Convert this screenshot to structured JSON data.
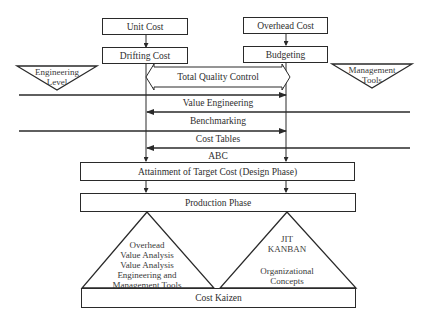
{
  "diagram": {
    "top_boxes": {
      "unit_cost": "Unit Cost",
      "drifting_cost": "Drifting Cost",
      "overhead_cost": "Overhead Cost",
      "budgeting": "Budgeting"
    },
    "side_triangles": {
      "engineering_level": [
        "Engineering",
        "Level"
      ],
      "management_tools": [
        "Management",
        "Tools"
      ]
    },
    "tqc": "Total Quality Control",
    "flow_lines": [
      {
        "label": "Value Engineering",
        "direction": "right"
      },
      {
        "label": "Benchmarking",
        "direction": "left"
      },
      {
        "label": "Cost Tables",
        "direction": "right"
      },
      {
        "label": "ABC",
        "direction": "left"
      }
    ],
    "attainment": "Attainment of Target Cost (Design Phase)",
    "production": "Production Phase",
    "bottom_triangles": {
      "left": [
        "Overhead",
        "Value Analysis",
        "Value Analysis",
        "Engineering and",
        "Management Tools"
      ],
      "right_top": [
        "JIT",
        "KANBAN"
      ],
      "right_bottom": [
        "Organizational",
        "Concepts"
      ]
    },
    "cost_kaizen": "Cost Kaizen",
    "colors": {
      "line": "#2a2a2a",
      "background": "#ffffff"
    }
  }
}
